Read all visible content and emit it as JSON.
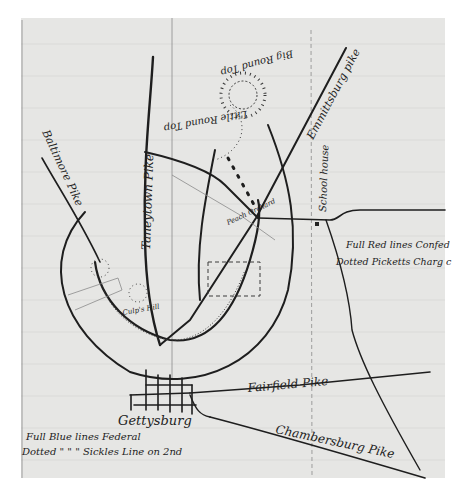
{
  "map": {
    "title": "Hand-drawn sketch map of Gettysburg battlefield",
    "colors": {
      "paper": "#e6e6e4",
      "ink": "#1e1e1e",
      "background": "#ffffff"
    },
    "roads": {
      "baltimore_pike": "Baltimore Pike",
      "taneytown_pike": "Taneytown Pike",
      "emmitsburg_pike": "Emmittsburg pike",
      "fairfield_pike": "Fairfield Pike",
      "chambersburg_pike": "Chambersburg Pike"
    },
    "places": {
      "big_round_top": "Big Round Top",
      "little_round_top": "Little Round Top",
      "peach_orchard": "Peach Orchard",
      "school_house": "School house",
      "culps_hill": "Culp's Hill",
      "cemetery_hill": "Cemetery",
      "town": "Gettysburg"
    },
    "legend": {
      "blue_line1": "Full Blue lines  Federal",
      "blue_line2": "Dotted \"   \"      \"  Sickles Line on 2nd",
      "red_line1": "Full Red lines Confed",
      "red_line2": "Dotted  Picketts Charg c"
    }
  }
}
